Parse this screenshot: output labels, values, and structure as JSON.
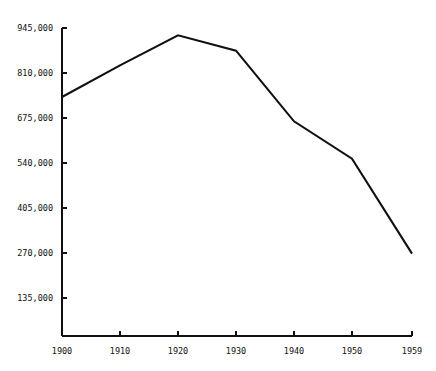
{
  "chart_data": {
    "type": "line",
    "title": "",
    "subtitle": "",
    "xlabel": "",
    "ylabel": "",
    "grid": false,
    "legend": false,
    "legend_position": "none",
    "line_color": "#111111",
    "background_color": "#ffffff",
    "axis_color": "#111111",
    "x": [
      1900,
      1910,
      1920,
      1930,
      1940,
      1950,
      1959
    ],
    "xtick_labels": [
      "1900",
      "1910",
      "1920",
      "1930",
      "1940",
      "1950",
      "1959"
    ],
    "ytick_labels": [
      "945,000",
      "810,000",
      "675,000",
      "540,000",
      "405,000",
      "270,000",
      "135,000"
    ],
    "ytick_values": [
      945000,
      810000,
      675000,
      540000,
      405000,
      270000,
      135000
    ],
    "xlim": [
      1900,
      1959
    ],
    "ylim": [
      0,
      945000
    ],
    "series": [
      {
        "name": "",
        "values": [
          738000,
          833000,
          923000,
          877000,
          665000,
          553000,
          268000
        ]
      }
    ],
    "points": [
      {
        "x": 1900,
        "y": 738000
      },
      {
        "x": 1910,
        "y": 833000
      },
      {
        "x": 1920,
        "y": 923000
      },
      {
        "x": 1930,
        "y": 877000
      },
      {
        "x": 1940,
        "y": 665000
      },
      {
        "x": 1950,
        "y": 553000
      },
      {
        "x": 1959,
        "y": 268000
      }
    ]
  },
  "axes": {
    "y_ticks": [
      {
        "label": "945,000",
        "px": 28
      },
      {
        "label": "810,000",
        "px": 73
      },
      {
        "label": "675,000",
        "px": 118
      },
      {
        "label": "540,000",
        "px": 163
      },
      {
        "label": "405,000",
        "px": 208
      },
      {
        "label": "270,000",
        "px": 253
      },
      {
        "label": "135,000",
        "px": 298
      }
    ],
    "x_ticks": [
      {
        "label": "1900",
        "px": 62
      },
      {
        "label": "1910",
        "px": 120
      },
      {
        "label": "1920",
        "px": 178
      },
      {
        "label": "1930",
        "px": 236
      },
      {
        "label": "1940",
        "px": 294
      },
      {
        "label": "1950",
        "px": 352
      },
      {
        "label": "1959",
        "px": 412
      }
    ]
  }
}
